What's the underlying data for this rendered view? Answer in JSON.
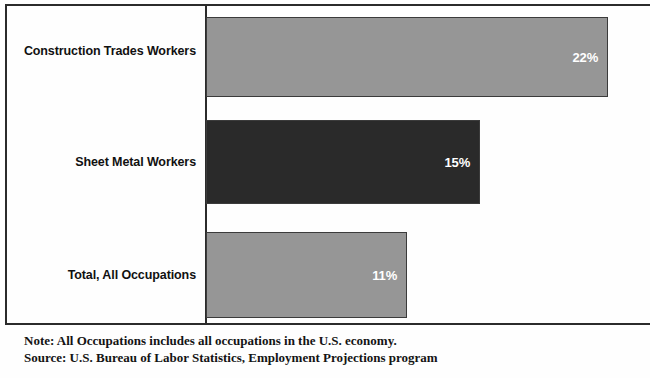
{
  "chart_data": {
    "type": "bar",
    "orientation": "horizontal",
    "title": "",
    "subtitle": "",
    "xlabel": "",
    "ylabel": "",
    "xlim": [
      0,
      24
    ],
    "grid": false,
    "legend": null,
    "unit": "%",
    "categories": [
      "Construction Trades Workers",
      "Sheet Metal Workers",
      "Total, All Occupations"
    ],
    "values": [
      22,
      15,
      11
    ],
    "data_labels": [
      "22%",
      "15%",
      "11%"
    ],
    "bar_colors": [
      "#969696",
      "#2a2a2a",
      "#969696"
    ],
    "series": [
      {
        "name": "Percent change, projected employment",
        "values": [
          22,
          15,
          11
        ]
      }
    ]
  },
  "bars": [
    {
      "label": "Construction Trades Workers",
      "value": 22,
      "value_text": "22%",
      "color": "#969696"
    },
    {
      "label": "Sheet Metal Workers",
      "value": 15,
      "value_text": "15%",
      "color": "#2a2a2a"
    },
    {
      "label": "Total, All Occupations",
      "value": 11,
      "value_text": "11%",
      "color": "#969696"
    }
  ],
  "footer": {
    "note": "Note: All Occupations includes all occupations in the U.S. economy.",
    "source": "Source: U.S. Bureau of Labor Statistics, Employment Projections program"
  },
  "colors": {
    "frame": "#2b2b2b",
    "bar_light": "#969696",
    "bar_dark": "#2a2a2a",
    "label_text": "#111111",
    "value_text": "#ffffff",
    "background": "#fefefe"
  }
}
